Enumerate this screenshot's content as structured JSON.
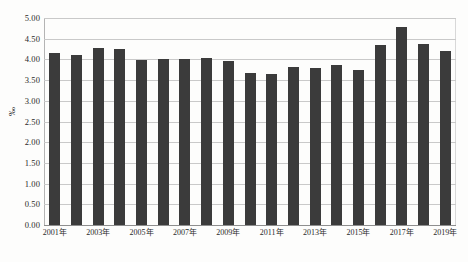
{
  "chart_data": {
    "type": "bar",
    "title": "",
    "xlabel": "",
    "ylabel": "‰",
    "ylim": [
      0.0,
      5.0
    ],
    "ytick_step": 0.5,
    "yticks": [
      "0.00",
      "0.50",
      "1.00",
      "1.50",
      "2.00",
      "2.50",
      "3.00",
      "3.50",
      "4.00",
      "4.50",
      "5.00"
    ],
    "grid": "horizontal",
    "legend": "none",
    "bar_color": "#3b3b3b",
    "grid_color": "#c9c9c9",
    "categories": [
      "2001年",
      "2002年",
      "2003年",
      "2004年",
      "2005年",
      "2006年",
      "2007年",
      "2008年",
      "2009年",
      "2010年",
      "2011年",
      "2012年",
      "2013年",
      "2014年",
      "2015年",
      "2016年",
      "2017年",
      "2018年",
      "2019年"
    ],
    "tick_labels_shown": [
      "2001年",
      "",
      "2003年",
      "",
      "2005年",
      "",
      "2007年",
      "",
      "2009年",
      "",
      "2011年",
      "",
      "2013年",
      "",
      "2015年",
      "",
      "2017年",
      "",
      "2019年"
    ],
    "values": [
      4.15,
      4.11,
      4.27,
      4.24,
      3.99,
      4.01,
      4.02,
      4.04,
      3.96,
      3.66,
      3.64,
      3.82,
      3.8,
      3.86,
      3.74,
      4.34,
      4.79,
      4.37,
      4.2
    ]
  },
  "caption": {
    "ghost_text": ""
  }
}
